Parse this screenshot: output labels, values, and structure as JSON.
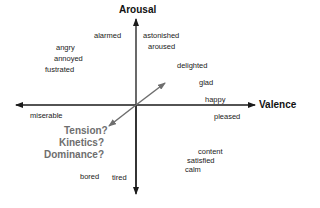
{
  "diagram": {
    "axes": {
      "vertical": {
        "label": "Arousal"
      },
      "horizontal": {
        "label": "Valence"
      },
      "diagonal": {
        "questions": [
          "Tension?",
          "Kinetics?",
          "Dominance?"
        ]
      }
    },
    "emotions": {
      "alarmed": "alarmed",
      "angry": "angry",
      "annoyed": "annoyed",
      "fustrated": "fustrated",
      "astonished": "astonished",
      "aroused": "aroused",
      "delighted": "delighted",
      "glad": "glad",
      "happy": "happy",
      "pleased": "pleased",
      "miserable": "miserable",
      "content": "content",
      "satisfied": "satisfied",
      "calm": "calm",
      "bored": "bored",
      "tired": "tired"
    },
    "colors": {
      "axis": "#1a1a1a",
      "diagonal_axis": "#6e6e6e",
      "question_text": "#6e6e6e"
    }
  }
}
